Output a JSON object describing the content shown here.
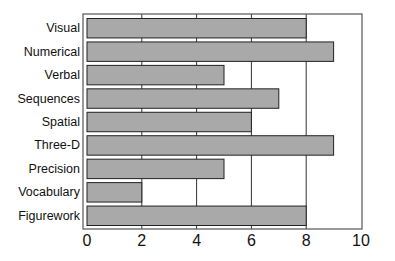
{
  "chart_data": {
    "type": "bar",
    "orientation": "horizontal",
    "title": "",
    "xlabel": "",
    "ylabel": "",
    "categories": [
      "Visual",
      "Numerical",
      "Verbal",
      "Sequences",
      "Spatial",
      "Three-D",
      "Precision",
      "Vocabulary",
      "Figurework"
    ],
    "values": [
      8,
      9,
      5,
      7,
      6,
      9,
      5,
      2,
      8
    ],
    "xlim": [
      0,
      10
    ],
    "xticks": [
      0,
      2,
      4,
      6,
      8,
      10
    ],
    "grid": "vertical lines at 2,4,6,8",
    "legend": "none",
    "bar_color": "#a9a9a9",
    "edge_color": "#222222"
  }
}
